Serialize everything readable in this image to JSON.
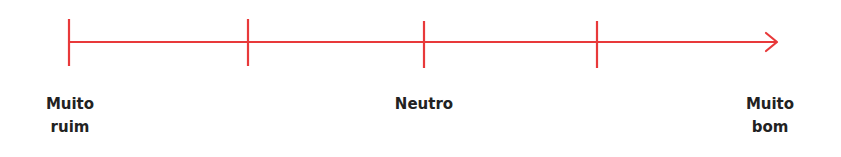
{
  "scale": {
    "line_color": "#e8393a",
    "text_color": "#222222",
    "ticks": [
      {
        "x": 69
      },
      {
        "x": 248
      },
      {
        "x": 424
      },
      {
        "x": 597
      }
    ],
    "labels": [
      {
        "line1": "Muito",
        "line2": "ruim",
        "x": 70
      },
      {
        "line1": "Neutro",
        "line2": "",
        "x": 424
      },
      {
        "line1": "Muito",
        "line2": "bom",
        "x": 770
      }
    ]
  }
}
